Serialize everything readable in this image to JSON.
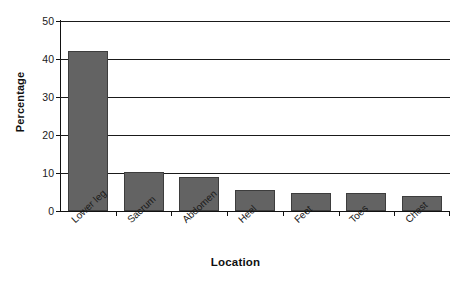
{
  "chart_data": {
    "type": "bar",
    "title": "",
    "xlabel": "Location",
    "ylabel": "Percentage",
    "categories": [
      "Lower leg",
      "Sacrum",
      "Abdomen",
      "Heel",
      "Feet",
      "Toes",
      "Chest"
    ],
    "values": [
      42,
      10.3,
      9,
      5.6,
      4.8,
      4.7,
      4
    ],
    "ylim": [
      0,
      50
    ],
    "yticks": [
      0,
      10,
      20,
      30,
      40,
      50
    ],
    "ytick_labels": [
      "0",
      "10",
      "20",
      "30",
      "40",
      "50"
    ],
    "grid": "horizontal",
    "legend": "none",
    "bar_color": "#636363",
    "bar_edge_color": "#3d3d3d",
    "axis_color": "#111111",
    "background": "#ffffff"
  },
  "axes": {
    "y_title": "Percentage",
    "x_title": "Location"
  }
}
